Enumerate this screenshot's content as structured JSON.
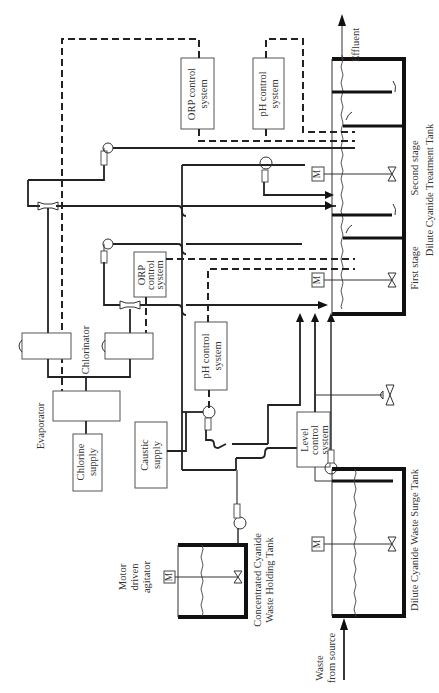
{
  "figure": {
    "orientation": "rotated 90° counter-clockwise"
  },
  "control_systems": {
    "orp_top": {
      "line1": "ORP control",
      "line2": "system"
    },
    "ph_top": {
      "line1": "pH control",
      "line2": "system"
    },
    "orp_mid": {
      "line1": "ORP",
      "line2": "control",
      "line3": "system"
    },
    "ph_mid": {
      "line1": "pH control",
      "line2": "system"
    },
    "level": {
      "line1": "Level",
      "line2": "control",
      "line3": "system"
    }
  },
  "equipment": {
    "evaporator": "Evaporator",
    "chlorinator": "Chlorinator",
    "chlorine_supply": {
      "line1": "Chlorine",
      "line2": "supply"
    },
    "caustic_supply": {
      "line1": "Caustic",
      "line2": "supply"
    },
    "motor_symbol": "M",
    "agitator": {
      "line1": "Motor",
      "line2": "driven",
      "line3": "agitator"
    }
  },
  "tanks": {
    "treatment": {
      "name": "Dilute Cyanide Treatment Tank",
      "stage1": "First stage",
      "stage2": "Second stage"
    },
    "holding": {
      "line1": "Concentrated Cyanide",
      "line2": "Waste Holding Tank"
    },
    "surge": {
      "name": "Dilute Cyanide Waste Surge Tank"
    }
  },
  "flows": {
    "effluent": "Effluent",
    "waste_source": {
      "line1": "Waste",
      "line2": "from source"
    }
  },
  "colors": {
    "line": "#222222",
    "box_border": "#555555",
    "text": "#333333",
    "background": "#ffffff"
  }
}
